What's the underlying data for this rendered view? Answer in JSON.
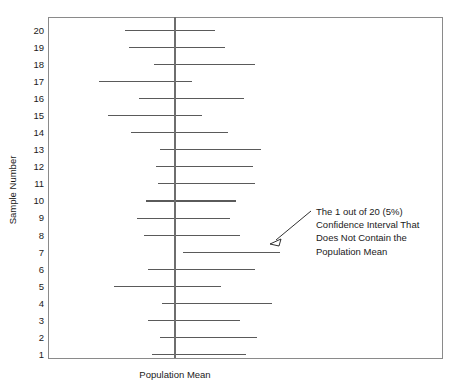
{
  "chart_data": {
    "type": "line",
    "title": "",
    "subtitle": "",
    "xlabel": "Population Mean",
    "ylabel": "Sample Number",
    "grid": false,
    "legend_position": "none",
    "orientation": "horizontal-intervals",
    "xlim": [
      0,
      100
    ],
    "ylim": [
      0.5,
      20.5
    ],
    "population_mean": 50,
    "confidence_level": "95%",
    "x_tick_labels": [],
    "y_tick_labels": [
      "1",
      "2",
      "3",
      "4",
      "5",
      "6",
      "7",
      "8",
      "9",
      "10",
      "11",
      "12",
      "13",
      "14",
      "15",
      "16",
      "17",
      "18",
      "19",
      "20"
    ],
    "categories": [
      1,
      2,
      3,
      4,
      5,
      6,
      7,
      8,
      9,
      10,
      11,
      12,
      13,
      14,
      15,
      16,
      17,
      18,
      19,
      20
    ],
    "series": [
      {
        "name": "Confidence Interval Lower Bound",
        "values": [
          39,
          43,
          37,
          44,
          21,
          37,
          54,
          35,
          32,
          36,
          42,
          41,
          43,
          29,
          18,
          33,
          14,
          40,
          28,
          26
        ]
      },
      {
        "name": "Confidence Interval Upper Bound",
        "values": [
          84,
          89,
          81,
          96,
          72,
          88,
          100,
          81,
          76,
          79,
          88,
          87,
          91,
          75,
          63,
          83,
          58,
          88,
          74,
          69
        ]
      }
    ],
    "intervals": [
      {
        "sample": 20,
        "lower": 26,
        "upper": 69,
        "contains_mean": true
      },
      {
        "sample": 19,
        "lower": 28,
        "upper": 74,
        "contains_mean": true
      },
      {
        "sample": 18,
        "lower": 40,
        "upper": 88,
        "contains_mean": true
      },
      {
        "sample": 17,
        "lower": 14,
        "upper": 58,
        "contains_mean": true
      },
      {
        "sample": 16,
        "lower": 33,
        "upper": 83,
        "contains_mean": true
      },
      {
        "sample": 15,
        "lower": 18,
        "upper": 63,
        "contains_mean": true
      },
      {
        "sample": 14,
        "lower": 29,
        "upper": 75,
        "contains_mean": true
      },
      {
        "sample": 13,
        "lower": 43,
        "upper": 91,
        "contains_mean": true
      },
      {
        "sample": 12,
        "lower": 41,
        "upper": 87,
        "contains_mean": true
      },
      {
        "sample": 11,
        "lower": 42,
        "upper": 88,
        "contains_mean": true
      },
      {
        "sample": 10,
        "lower": 36,
        "upper": 79,
        "contains_mean": true
      },
      {
        "sample": 9,
        "lower": 32,
        "upper": 76,
        "contains_mean": true
      },
      {
        "sample": 8,
        "lower": 35,
        "upper": 81,
        "contains_mean": true
      },
      {
        "sample": 7,
        "lower": 54,
        "upper": 100,
        "contains_mean": false
      },
      {
        "sample": 6,
        "lower": 37,
        "upper": 88,
        "contains_mean": true
      },
      {
        "sample": 5,
        "lower": 21,
        "upper": 72,
        "contains_mean": true
      },
      {
        "sample": 4,
        "lower": 44,
        "upper": 96,
        "contains_mean": true
      },
      {
        "sample": 3,
        "lower": 37,
        "upper": 81,
        "contains_mean": true
      },
      {
        "sample": 2,
        "lower": 43,
        "upper": 89,
        "contains_mean": true
      },
      {
        "sample": 1,
        "lower": 39,
        "upper": 84,
        "contains_mean": true
      }
    ],
    "annotation": {
      "lines": [
        "The 1 out of 20 (5%)",
        "Confidence Interval That",
        "Does Not Contain the",
        "Population Mean"
      ],
      "points_to_sample": 7,
      "has_arrow": true
    },
    "colors": {
      "interval_line": "#5a5a5a",
      "mean_line": "#6e6e6e",
      "frame": "#8a8a8a",
      "text": "#1a1a1a",
      "background": "#ffffff"
    }
  }
}
